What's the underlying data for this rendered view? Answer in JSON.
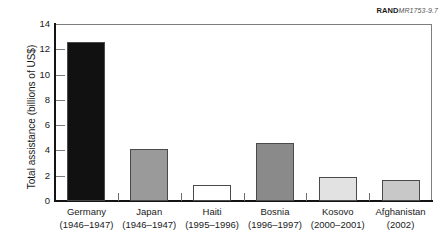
{
  "figure": {
    "source_mark": "RAND",
    "figure_number": "MR1753-9.7"
  },
  "chart_data": {
    "type": "bar",
    "title": "",
    "xlabel": "",
    "ylabel": "Total assistance (billions of US$)",
    "ylim": [
      0,
      14
    ],
    "ytick_step": 2,
    "ytick_labels": [
      "0",
      "2",
      "4",
      "6",
      "8",
      "10",
      "12",
      "14"
    ],
    "grid": false,
    "legend": "none",
    "categories": [
      "Germany",
      "Japan",
      "Haiti",
      "Bosnia",
      "Kosovo",
      "Afghanistan"
    ],
    "category_periods": [
      "(1946–1947)",
      "(1946–1947)",
      "(1995–1996)",
      "(1996–1997)",
      "(2000–2001)",
      "(2002)"
    ],
    "values": [
      12.55,
      4.15,
      1.25,
      4.6,
      1.9,
      1.65
    ],
    "bar_colors": [
      "#111111",
      "#9a9a9a",
      "#ffffff",
      "#8a8a8a",
      "#e2e2e2",
      "#c8c8c8"
    ],
    "bar_edge_color": "#4a4a4a"
  }
}
